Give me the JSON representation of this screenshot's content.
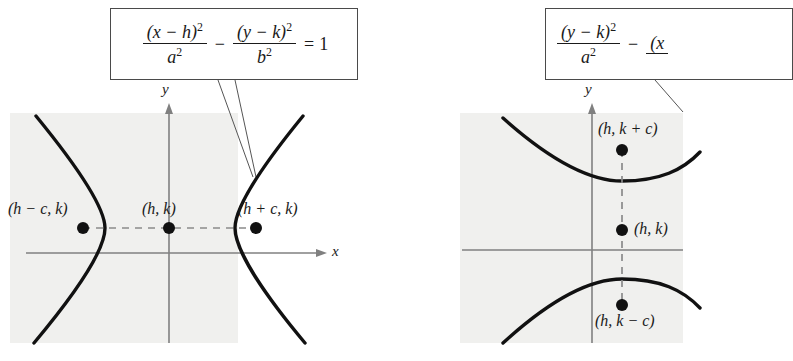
{
  "figure": {
    "panel_bg_color": "#f0f0ee",
    "curve_color": "#111111",
    "axis_color": "#808080",
    "dash_color": "#888888"
  },
  "left_diagram": {
    "name": "horizontal-transverse-axis-hyperbola",
    "formula": {
      "numerator_1": "(x − h)",
      "numerator_1_exp": "2",
      "denominator_1": "a",
      "denominator_1_exp": "2",
      "operator": "−",
      "numerator_2": "(y − k)",
      "numerator_2_exp": "2",
      "denominator_2": "b",
      "denominator_2_exp": "2",
      "equals": "=",
      "rhs": "1"
    },
    "axis_labels": {
      "y": "y",
      "x": "x"
    },
    "points": [
      {
        "label": "(h − c, k)",
        "role": "left-focus"
      },
      {
        "label": "(h, k)",
        "role": "center"
      },
      {
        "label": "(h + c, k)",
        "role": "right-focus"
      }
    ]
  },
  "right_diagram": {
    "name": "vertical-transverse-axis-hyperbola",
    "formula": {
      "numerator_1": "(y − k)",
      "numerator_1_exp": "2",
      "denominator_1": "a",
      "denominator_1_exp": "2",
      "operator": "−",
      "numerator_2": "(x",
      "numerator_2_exp": "",
      "denominator_2": "",
      "denominator_2_exp": "",
      "equals": "",
      "rhs": ""
    },
    "axis_labels": {
      "y": "y",
      "x": ""
    },
    "points": [
      {
        "label": "(h, k + c)",
        "role": "upper-focus"
      },
      {
        "label": "(h, k)",
        "role": "center"
      },
      {
        "label": "(h, k − c)",
        "role": "lower-focus"
      }
    ]
  }
}
